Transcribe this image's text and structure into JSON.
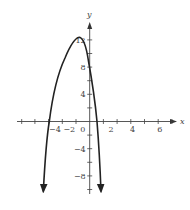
{
  "chart_data": {
    "type": "line",
    "title": "",
    "xlabel": "x",
    "ylabel": "y",
    "xlim": [
      -5,
      6.5
    ],
    "ylim": [
      -10,
      14
    ],
    "grid": false,
    "legend": null,
    "x_tick_labels": [
      {
        "value": -4,
        "label": "-4"
      },
      {
        "value": -2,
        "label": "-2"
      },
      {
        "value": 0,
        "label": "0"
      },
      {
        "value": 2,
        "label": "2"
      },
      {
        "value": 4,
        "label": "4"
      },
      {
        "value": 6,
        "label": "6"
      }
    ],
    "y_tick_labels": [
      {
        "value": 12,
        "label": "12"
      },
      {
        "value": 8,
        "label": "8"
      },
      {
        "value": 4,
        "label": "4"
      },
      {
        "value": -4,
        "label": "-4"
      },
      {
        "value": -8,
        "label": "-8"
      }
    ],
    "series": [
      {
        "name": "parabola",
        "description": "downward-opening parabola with arrows at both ends",
        "vertex": {
          "x": -0.8,
          "y": 12.3
        },
        "x_intercepts": [
          -3.0,
          0.5
        ],
        "points": [
          {
            "x": -3.4,
            "y": -10
          },
          {
            "x": -3.0,
            "y": 0
          },
          {
            "x": -2.65,
            "y": 4.5
          },
          {
            "x": -2.05,
            "y": 9
          },
          {
            "x": -0.8,
            "y": 12.3
          },
          {
            "x": -0.1,
            "y": 9
          },
          {
            "x": 0.25,
            "y": 4.5
          },
          {
            "x": 0.5,
            "y": 0
          },
          {
            "x": 0.8,
            "y": -10
          }
        ]
      }
    ]
  }
}
